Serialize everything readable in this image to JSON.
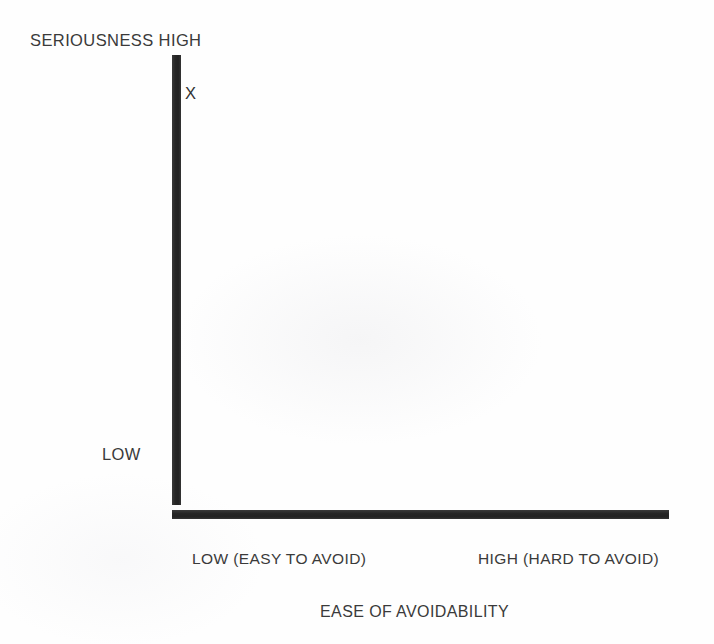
{
  "chart_data": {
    "type": "scatter",
    "title": "",
    "xlabel": "EASE OF AVOIDABILITY",
    "ylabel": "SERIOUSNESS",
    "x_axis": {
      "title": "EASE OF AVOIDABILITY",
      "low_label": "LOW (EASY TO AVOID)",
      "high_label": "HIGH (HARD TO AVOID)",
      "ticks": [
        "LOW (EASY TO AVOID)",
        "HIGH (HARD TO AVOID)"
      ],
      "range_labels": [
        "LOW (EASY TO AVOID)",
        "HIGH (HARD TO AVOID)"
      ]
    },
    "y_axis": {
      "title": "SERIOUSNESS",
      "high_label": "SERIOUSNESS HIGH",
      "low_label": "LOW",
      "ticks": [
        "LOW",
        "HIGH"
      ]
    },
    "points": [
      {
        "label": "X",
        "x_position": "low",
        "y_position": "high",
        "x_value": 0.03,
        "y_value": 0.93
      }
    ],
    "grid": false,
    "legend": null,
    "axis_color": "#2b2b2b",
    "background_color": "#fefefe"
  },
  "figure": {
    "y_axis_high_label": "SERIOUSNESS HIGH",
    "y_axis_low_label": "LOW",
    "data_marker": "X",
    "x_axis_low_label": "LOW (EASY TO AVOID)",
    "x_axis_high_label": "HIGH (HARD TO AVOID)",
    "x_axis_title": "EASE OF AVOIDABILITY"
  },
  "colors": {
    "axis": "#2b2b2b",
    "text": "#3a3a3a",
    "background": "#fefefe"
  }
}
